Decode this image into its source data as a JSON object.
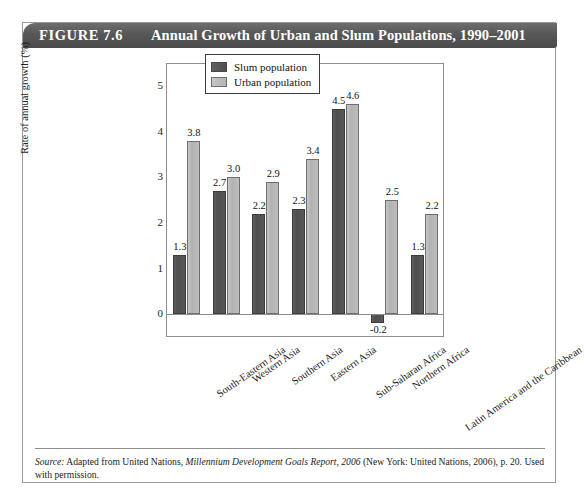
{
  "figure": {
    "number": "FIGURE 7.6",
    "title": "Annual Growth of Urban and Slum Populations, 1990–2001"
  },
  "legend": {
    "position": "top-right",
    "items": [
      {
        "label": "Slum population",
        "color": "#565656",
        "swatch": "slum-swatch"
      },
      {
        "label": "Urban population",
        "color": "#b8b8b8",
        "swatch": "urban-swatch"
      }
    ]
  },
  "axes": {
    "ylabel": "Rate of annual growth (%)",
    "xlabel": "",
    "yticks": [
      "5",
      "4",
      "3",
      "2",
      "1",
      "0"
    ]
  },
  "source": {
    "label": "Source:",
    "line1_a": " Adapted from United Nations, ",
    "line1_b": "Millennium Development Goals Report, 2006",
    "line1_c": " (New York: United Nations, 2006), p. 20.",
    "line2": "Used with permission."
  },
  "chart_data": {
    "type": "bar",
    "title": "Annual Growth of Urban and Slum Populations, 1990–2001",
    "xlabel": "",
    "ylabel": "Rate of annual growth (%)",
    "ylim": [
      -0.5,
      5.5
    ],
    "yticks": [
      0,
      1,
      2,
      3,
      4,
      5
    ],
    "grid": false,
    "legend_position": "top-right",
    "categories": [
      "South-Eastern Asia",
      "Western Asia",
      "Southern Asia",
      "Eastern Asia",
      "Sub-Saharan Africa",
      "Northern Africa",
      "Latin America and the Caribbean"
    ],
    "series": [
      {
        "name": "Slum population",
        "color": "#565656",
        "values": [
          1.3,
          2.7,
          2.2,
          2.3,
          4.5,
          -0.2,
          1.3
        ],
        "labels": [
          "1.3",
          "2.7",
          "2.2",
          "2.3",
          "4.5",
          "-0.2",
          "1.3"
        ]
      },
      {
        "name": "Urban population",
        "color": "#b8b8b8",
        "values": [
          3.8,
          3.0,
          2.9,
          3.4,
          4.6,
          2.5,
          2.2
        ],
        "labels": [
          "3.8",
          "3.0",
          "2.9",
          "3.4",
          "4.6",
          "2.5",
          "2.2"
        ]
      }
    ]
  }
}
